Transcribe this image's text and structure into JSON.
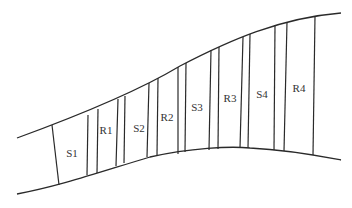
{
  "diagram": {
    "type": "multistage turbomachine meridional flow path",
    "colors": {
      "line": "#2a2a2a",
      "text": "#333333",
      "background": "#ffffff"
    },
    "walls": {
      "outer": "M17,138 C80,115 140,90 180,66 C230,40 280,18 341,13",
      "inner": "M17,194 C60,186 100,172 150,157 C190,148 230,146 250,148 C290,150 320,156 341,160"
    },
    "blade_rows": [
      {
        "x1": 52,
        "y1": 125,
        "x2": 59,
        "y2": 185
      },
      {
        "x1": 88,
        "y1": 115,
        "x2": 87,
        "y2": 175
      },
      {
        "x1": 98,
        "y1": 109,
        "x2": 97,
        "y2": 173
      },
      {
        "x1": 118,
        "y1": 99,
        "x2": 116,
        "y2": 166
      },
      {
        "x1": 125,
        "y1": 96,
        "x2": 124,
        "y2": 163
      },
      {
        "x1": 149,
        "y1": 83,
        "x2": 147,
        "y2": 157
      },
      {
        "x1": 158,
        "y1": 78,
        "x2": 157,
        "y2": 155
      },
      {
        "x1": 178,
        "y1": 67,
        "x2": 178,
        "y2": 154
      },
      {
        "x1": 186,
        "y1": 63,
        "x2": 185,
        "y2": 152
      },
      {
        "x1": 211,
        "y1": 50,
        "x2": 209,
        "y2": 150
      },
      {
        "x1": 219,
        "y1": 47,
        "x2": 218,
        "y2": 149
      },
      {
        "x1": 243,
        "y1": 37,
        "x2": 240,
        "y2": 148
      },
      {
        "x1": 250,
        "y1": 34,
        "x2": 248,
        "y2": 148
      },
      {
        "x1": 275,
        "y1": 25,
        "x2": 274,
        "y2": 150
      },
      {
        "x1": 287,
        "y1": 22,
        "x2": 284,
        "y2": 151
      },
      {
        "x1": 315,
        "y1": 16,
        "x2": 313,
        "y2": 155
      }
    ],
    "labels": [
      {
        "text": "S1",
        "x": 72,
        "y": 157
      },
      {
        "text": "R1",
        "x": 106,
        "y": 134
      },
      {
        "text": "S2",
        "x": 139,
        "y": 132
      },
      {
        "text": "R2",
        "x": 167,
        "y": 121
      },
      {
        "text": "S3",
        "x": 197,
        "y": 111
      },
      {
        "text": "R3",
        "x": 230,
        "y": 102
      },
      {
        "text": "S4",
        "x": 262,
        "y": 98
      },
      {
        "text": "R4",
        "x": 299,
        "y": 92
      }
    ]
  }
}
